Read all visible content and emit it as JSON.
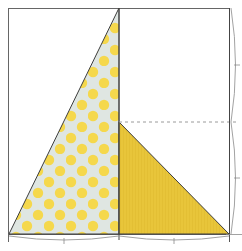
{
  "diagram": {
    "type": "quilt-block-construction",
    "block": {
      "x": 8,
      "y": 8,
      "width": 222,
      "height": 227
    },
    "colors": {
      "background": "#ffffff",
      "outline": "#555555",
      "dots_base": "#dfe6e2",
      "dots": "#f5d84c",
      "solid_yellow": "#e8c53a",
      "dimension_line": "#8a8a8a",
      "dashed_guide": "#9a9a9a"
    },
    "pieces": [
      {
        "name": "polka-dot-triangle",
        "fabric": "light gray with yellow polka dots",
        "points": "9,234 119,8 119,234"
      },
      {
        "name": "solid-yellow-triangle",
        "fabric": "solid yellow",
        "points": "119,122 119,234 229,234"
      }
    ],
    "guides": {
      "center_vertical_x": 119,
      "dashed_horizontal_y": 122
    },
    "dimensions": {
      "bottom_segments": [
        {
          "from": 9,
          "to": 119,
          "tick": 64
        },
        {
          "from": 119,
          "to": 229,
          "tick": 174
        }
      ],
      "right_segments": [
        {
          "from": 8,
          "to": 122,
          "tick": 65
        },
        {
          "from": 122,
          "to": 234,
          "tick": 178
        }
      ]
    }
  }
}
